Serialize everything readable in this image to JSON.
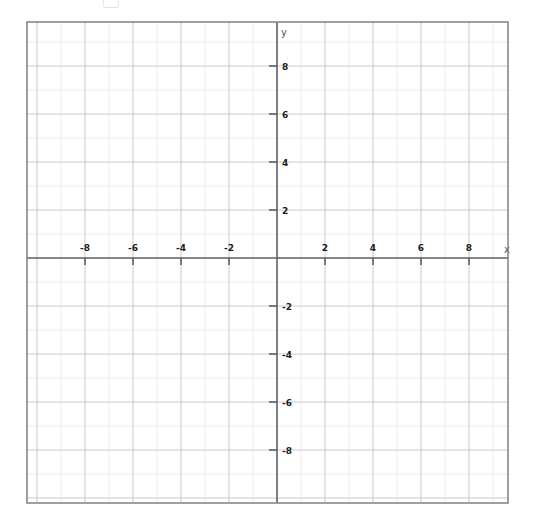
{
  "figure": {
    "kind": "cartesian-coordinate-grid",
    "width": 537,
    "height": 512,
    "background_color": "#ffffff",
    "frame": {
      "left": 27,
      "top": 22,
      "right": 508,
      "bottom": 503,
      "border_color": "#808080",
      "border_width": 1.5
    },
    "origin_px": {
      "x": 277,
      "y": 258
    },
    "unit_px": 24,
    "axis_color": "#5f5f63",
    "grid_minor_color": "#ececee",
    "grid_major_color": "#c9c9cd",
    "label_color": "#1a1a1a",
    "axis_name_color": "#55555a"
  },
  "axes": {
    "x": {
      "name": "x",
      "name_px": {
        "x": 507,
        "y": 253
      },
      "min": -10.4,
      "max": 9.6,
      "tick_step": 2,
      "minor_step": 1,
      "tick_values": [
        -8,
        -6,
        -4,
        -2,
        2,
        4,
        6,
        8
      ],
      "tick_labels": [
        "-8",
        "-6",
        "-4",
        "-2",
        "2",
        "4",
        "6",
        "8"
      ],
      "label_side": "above",
      "tick_direction": "below"
    },
    "y": {
      "name": "y",
      "name_px": {
        "x": 281,
        "y": 36
      },
      "min": -10.2,
      "max": 9.8,
      "tick_step": 2,
      "minor_step": 1,
      "tick_values": [
        8,
        6,
        4,
        2,
        -2,
        -4,
        -6,
        -8
      ],
      "tick_labels": [
        "8",
        "6",
        "4",
        "2",
        "-2",
        "-4",
        "-6",
        "-8"
      ],
      "label_side": "right",
      "tick_direction": "left"
    }
  },
  "chart_data": {
    "type": "scatter",
    "title": "",
    "subtitle": "",
    "xlabel": "x",
    "ylabel": "y",
    "xlim": [
      -10.4,
      9.6
    ],
    "ylim": [
      -10.2,
      9.8
    ],
    "xticks": [
      -8,
      -6,
      -4,
      -2,
      2,
      4,
      6,
      8
    ],
    "yticks": [
      -8,
      -6,
      -4,
      -2,
      2,
      4,
      6,
      8
    ],
    "xtick_labels": [
      "-8",
      "-6",
      "-4",
      "-2",
      "2",
      "4",
      "6",
      "8"
    ],
    "ytick_labels": [
      "-8",
      "-6",
      "-4",
      "-2",
      "2",
      "4",
      "6",
      "8"
    ],
    "grid": true,
    "grid_minor_step": 1,
    "grid_major_step": 2,
    "legend": null,
    "series": [],
    "annotations": [],
    "note": "Empty blank Cartesian coordinate plane for plotting; no data plotted."
  },
  "artifact": {
    "name": "scan-artifact-top",
    "description": "faint cropped mark at top edge"
  }
}
